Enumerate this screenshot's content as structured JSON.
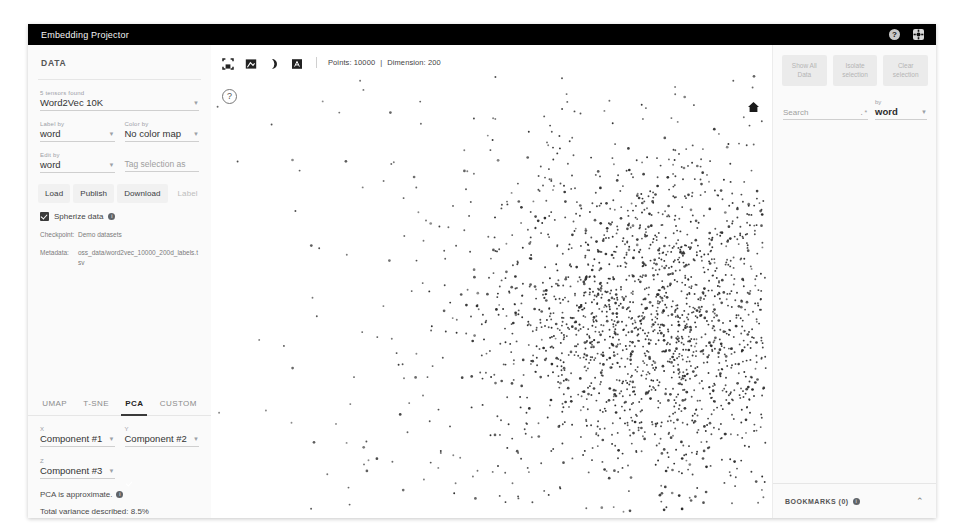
{
  "header": {
    "title": "Embedding Projector",
    "help_icon": "help-icon",
    "settings_icon": "gear-icon"
  },
  "data_panel": {
    "title": "DATA",
    "tensor_count_label": "5 tensors found",
    "tensor_value": "Word2Vec 10K",
    "label_by_label": "Label by",
    "label_by_value": "word",
    "color_by_label": "Color by",
    "color_by_value": "No color map",
    "edit_by_label": "Edit by",
    "edit_by_value": "word",
    "tag_placeholder": "Tag selection as",
    "buttons": [
      {
        "label": "Load",
        "disabled": false
      },
      {
        "label": "Publish",
        "disabled": false
      },
      {
        "label": "Download",
        "disabled": false
      },
      {
        "label": "Label",
        "disabled": true
      }
    ],
    "spherize_label": "Spherize data",
    "checkpoint_key": "Checkpoint:",
    "checkpoint_value": "Demo datasets",
    "metadata_key": "Metadata:",
    "metadata_value": "oss_data/word2vec_10000_200d_labels.tsv"
  },
  "projections": {
    "tabs": [
      {
        "label": "UMAP",
        "active": false
      },
      {
        "label": "T-SNE",
        "active": false
      },
      {
        "label": "PCA",
        "active": true
      },
      {
        "label": "CUSTOM",
        "active": false
      }
    ],
    "x_label": "X",
    "x_value": "Component #1",
    "y_label": "Y",
    "y_value": "Component #2",
    "z_label": "Z",
    "z_value": "Component #3",
    "approx_note": "PCA is approximate.",
    "variance_note": "Total variance described: 8.5%"
  },
  "main": {
    "toolbar_icons": [
      "select-rectangle-icon",
      "edit-image-icon",
      "night-mode-icon",
      "labels-icon"
    ],
    "points_label": "Points: 10000",
    "dimension_label": "Dimension: 200",
    "separator": "|",
    "help_icon": "question-circle-icon",
    "home_icon": "home-icon"
  },
  "inspector": {
    "buttons": [
      "Show All Data",
      "Isolate selection",
      "Clear selection"
    ],
    "search_placeholder": "Search",
    "regex_icon": ".*",
    "by_label": "by",
    "by_value": "word",
    "bookmarks_title": "BOOKMARKS (0)",
    "bookmarks_chevron": "chevron-up-icon"
  },
  "chart_data": {
    "type": "scatter",
    "point_count": 10000,
    "rendered_points": 2600,
    "dimension": 200,
    "projection": "PCA",
    "x_axis": "Component #1",
    "y_axis": "Component #2",
    "z_axis": "Component #3",
    "total_variance_percent": 8.5,
    "point_color": "#2b2b2b",
    "background": "#ffffff",
    "cluster_center": [
      450,
      275
    ],
    "cluster_spread": [
      105,
      95
    ],
    "grid": false,
    "legend": false
  }
}
